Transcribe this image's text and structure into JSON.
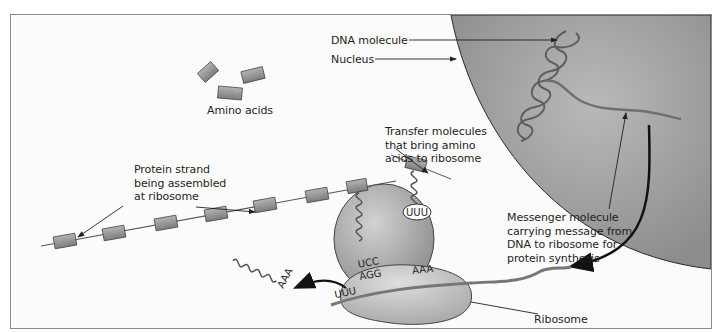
{
  "diagram": {
    "type": "protein synthesis schematic",
    "labels": {
      "dna_molecule": "DNA molecule",
      "nucleus": "Nucleus",
      "amino_acids": "Amino acids",
      "transfer_molecules": [
        "Transfer molecules",
        "that bring amino",
        "acids to ribosome"
      ],
      "protein_strand": [
        "Protein strand",
        "being assembled",
        "at ribosome"
      ],
      "messenger_molecule": [
        "Messenger molecule",
        "carrying message from",
        "DNA to ribosome for",
        "protein synthesis"
      ],
      "ribosome": "Ribosome"
    },
    "codons": {
      "trna_bubble": "UUU",
      "anticodon_bound": "UCC",
      "mrna_codon_bound": "AGG",
      "mrna_codon_next": "AAA",
      "mrna_codon_exiting": "UUU",
      "released_trna": "AAA"
    },
    "colors": {
      "nucleus": "#9a9a9a",
      "ribosome": "#b4b4b4",
      "amino_block": "#8f8f8f",
      "strand": "#6b6b6b",
      "text": "#231f20",
      "frame": "#8a8a8a"
    }
  }
}
